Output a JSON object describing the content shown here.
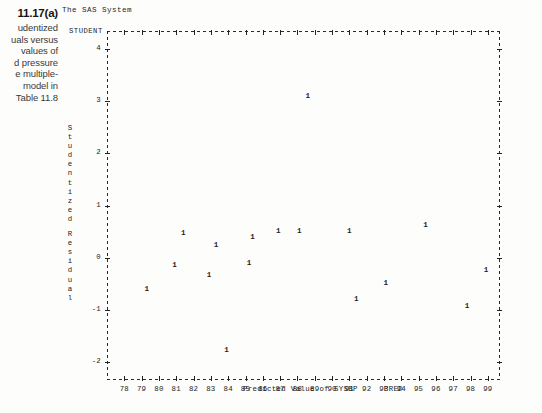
{
  "caption": {
    "figure_number": "11.17(a)",
    "lines": [
      "udentized",
      "uals versus",
      " values of",
      "d pressure",
      "e multiple-",
      " model in",
      "Table 11.8"
    ]
  },
  "sas": {
    "title": "The SAS System",
    "legend_label": "STUDENT"
  },
  "chart_data": {
    "type": "scatter",
    "title": "The SAS System",
    "xlabel": "Predicted Value of SYSBP",
    "xvar": "PRED",
    "ylabel": "Studentized Residual",
    "yvar": "STUDENT",
    "plot_symbol": "1",
    "grid": false,
    "legend_position": "top-left",
    "xlim": [
      77.0,
      99.7
    ],
    "ylim": [
      -2.35,
      4.35
    ],
    "xticks": [
      78,
      79,
      80,
      81,
      82,
      83,
      84,
      85,
      86,
      87,
      88,
      89,
      90,
      91,
      92,
      93,
      94,
      95,
      96,
      97,
      98,
      99
    ],
    "yticks": [
      4,
      3,
      2,
      1,
      0,
      -1,
      -2
    ],
    "n_points": 17,
    "points": [
      {
        "x": 88.6,
        "y": 3.08
      },
      {
        "x": 79.3,
        "y": -0.62
      },
      {
        "x": 81.4,
        "y": 0.45
      },
      {
        "x": 80.9,
        "y": -0.17
      },
      {
        "x": 83.3,
        "y": 0.22
      },
      {
        "x": 82.9,
        "y": -0.35
      },
      {
        "x": 83.9,
        "y": -1.8
      },
      {
        "x": 85.4,
        "y": 0.37
      },
      {
        "x": 85.2,
        "y": -0.12
      },
      {
        "x": 86.9,
        "y": 0.5
      },
      {
        "x": 88.1,
        "y": 0.5
      },
      {
        "x": 91.0,
        "y": 0.5
      },
      {
        "x": 91.4,
        "y": -0.82
      },
      {
        "x": 93.1,
        "y": -0.5
      },
      {
        "x": 95.4,
        "y": 0.6
      },
      {
        "x": 97.8,
        "y": -0.95
      },
      {
        "x": 98.9,
        "y": -0.25
      }
    ]
  }
}
